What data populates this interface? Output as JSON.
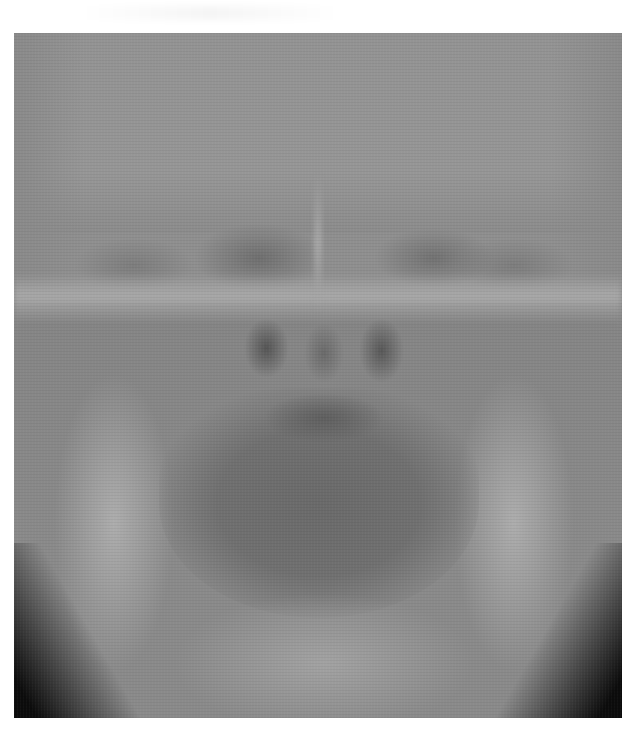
{
  "image": {
    "type": "radiograph",
    "view": "frontal skull / mandible X-ray",
    "colors": {
      "background": "#ffffff",
      "film_mid_gray": "#8f8f8f",
      "bone_light": "#adadad",
      "airway_dark": "#555555",
      "corner_black": "#0c0c0c"
    }
  }
}
